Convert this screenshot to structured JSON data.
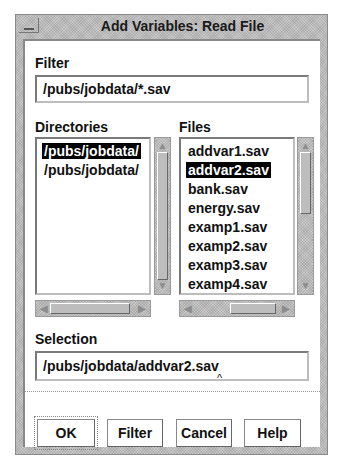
{
  "window": {
    "title": "Add Variables: Read File"
  },
  "filter": {
    "label": "Filter",
    "value": "/pubs/jobdata/*.sav"
  },
  "directories": {
    "label": "Directories",
    "items": [
      {
        "name": "/pubs/jobdata/",
        "selected": true
      },
      {
        "name": "/pubs/jobdata/",
        "selected": false
      }
    ]
  },
  "files": {
    "label": "Files",
    "items": [
      {
        "name": "addvar1.sav",
        "selected": false
      },
      {
        "name": "addvar2.sav",
        "selected": true
      },
      {
        "name": "bank.sav",
        "selected": false
      },
      {
        "name": "energy.sav",
        "selected": false
      },
      {
        "name": "examp1.sav",
        "selected": false
      },
      {
        "name": "examp2.sav",
        "selected": false
      },
      {
        "name": "examp3.sav",
        "selected": false
      },
      {
        "name": "examp4.sav",
        "selected": false
      }
    ]
  },
  "selection": {
    "label": "Selection",
    "value": "/pubs/jobdata/addvar2.sav",
    "caret": "^"
  },
  "buttons": {
    "ok": "OK",
    "filter": "Filter",
    "cancel": "Cancel",
    "help": "Help"
  },
  "icons": {
    "scroll_up": "▲",
    "scroll_down": "▼",
    "scroll_left": "◀",
    "scroll_right": "▶"
  }
}
